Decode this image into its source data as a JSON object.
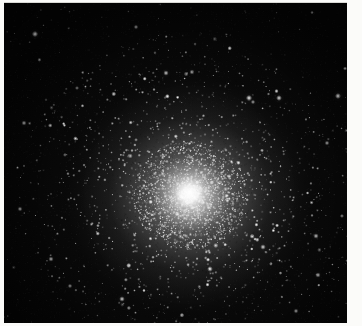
{
  "figure": {
    "kind": "astronomical-photograph",
    "caption": "Globular cluster: dense spherical concentration of stars with bright unresolved core and resolved halo"
  },
  "plate": {
    "background_color": "#050505",
    "paper_color": "#fbfbf9",
    "star_color": "#ffffff",
    "width": 343,
    "height": 320,
    "offset_x": 4,
    "offset_y": 3
  },
  "cluster": {
    "center_x": 186,
    "center_y": 192,
    "core_radius": 22,
    "halo_radius": 108,
    "outer_radius": 168,
    "core_peak_brightness": 1.0,
    "resolved_star_count": 2600,
    "field_star_count": 430
  },
  "notable_field_stars": [
    {
      "x": 31,
      "y": 31,
      "r": 2.6,
      "b": 0.95
    },
    {
      "x": 20,
      "y": 120,
      "r": 2.0,
      "b": 0.8
    },
    {
      "x": 16,
      "y": 206,
      "r": 1.9,
      "b": 0.78
    },
    {
      "x": 47,
      "y": 256,
      "r": 2.1,
      "b": 0.82
    },
    {
      "x": 73,
      "y": 85,
      "r": 1.6,
      "b": 0.68
    },
    {
      "x": 132,
      "y": 24,
      "r": 1.8,
      "b": 0.72
    },
    {
      "x": 162,
      "y": 70,
      "r": 2.2,
      "b": 0.86
    },
    {
      "x": 188,
      "y": 69,
      "r": 2.0,
      "b": 0.8
    },
    {
      "x": 245,
      "y": 95,
      "r": 2.6,
      "b": 0.95
    },
    {
      "x": 249,
      "y": 99,
      "r": 1.8,
      "b": 0.74
    },
    {
      "x": 275,
      "y": 95,
      "r": 2.4,
      "b": 0.92
    },
    {
      "x": 334,
      "y": 93,
      "r": 2.5,
      "b": 0.93
    },
    {
      "x": 323,
      "y": 140,
      "r": 1.9,
      "b": 0.78
    },
    {
      "x": 312,
      "y": 233,
      "r": 2.2,
      "b": 0.86
    },
    {
      "x": 259,
      "y": 244,
      "r": 2.3,
      "b": 0.88
    },
    {
      "x": 206,
      "y": 266,
      "r": 2.4,
      "b": 0.9
    },
    {
      "x": 118,
      "y": 296,
      "r": 2.3,
      "b": 0.88
    },
    {
      "x": 66,
      "y": 283,
      "r": 1.8,
      "b": 0.74
    },
    {
      "x": 314,
      "y": 272,
      "r": 2.1,
      "b": 0.84
    },
    {
      "x": 292,
      "y": 308,
      "r": 1.9,
      "b": 0.78
    }
  ]
}
